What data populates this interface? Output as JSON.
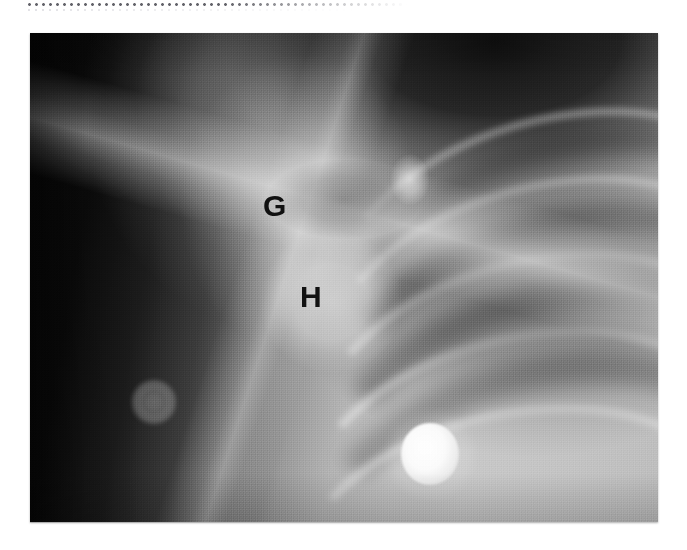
{
  "page": {
    "background_color": "#ffffff",
    "width": 687,
    "height": 550
  },
  "scan_artifact": {
    "name": "dotted-scan-line",
    "description": "faint dotted horizontal line along the very top of the page"
  },
  "radiograph": {
    "modality": "X-ray",
    "view": "shoulder / upper chest radiograph",
    "frame": {
      "left": 30,
      "top": 33,
      "width": 628,
      "height": 489
    },
    "background_color": "#0b0b0b",
    "bright_color": "#c8c8c8",
    "annotations": [
      {
        "id": "g",
        "letter": "G",
        "meaning": "glenoid",
        "x": 233,
        "y": 158,
        "color": "#111111"
      },
      {
        "id": "h",
        "letter": "H",
        "meaning": "humeral head",
        "x": 270,
        "y": 249,
        "color": "#111111"
      }
    ],
    "objects": [
      {
        "id": "ecg-electrode",
        "label": "bright round radiopaque marker",
        "x": 400,
        "y": 421,
        "radius": 29
      },
      {
        "id": "faint-disc",
        "label": "faint circular disc over dark soft tissue",
        "x": 124,
        "y": 369,
        "radius": 22
      }
    ],
    "ribs": [
      {
        "id": "rib-1",
        "left": 300,
        "top": 84,
        "width": 430,
        "height": 250,
        "rotate": -16,
        "thickness": 7,
        "opacity": 0.38
      },
      {
        "id": "rib-2",
        "left": 292,
        "top": 150,
        "width": 430,
        "height": 250,
        "rotate": -15,
        "thickness": 8,
        "opacity": 0.4
      },
      {
        "id": "rib-3",
        "left": 282,
        "top": 224,
        "width": 430,
        "height": 250,
        "rotate": -14,
        "thickness": 9,
        "opacity": 0.42
      },
      {
        "id": "rib-4",
        "left": 272,
        "top": 300,
        "width": 430,
        "height": 250,
        "rotate": -13,
        "thickness": 9,
        "opacity": 0.4
      },
      {
        "id": "rib-5",
        "left": 262,
        "top": 376,
        "width": 430,
        "height": 250,
        "rotate": -12,
        "thickness": 9,
        "opacity": 0.34
      }
    ],
    "intercostals": [
      {
        "id": "ic-1",
        "left": 300,
        "top": 104,
        "width": 430,
        "height": 250,
        "rotate": -16,
        "thickness": 26,
        "opacity": 0.22
      },
      {
        "id": "ic-2",
        "left": 292,
        "top": 176,
        "width": 430,
        "height": 250,
        "rotate": -15,
        "thickness": 30,
        "opacity": 0.26
      },
      {
        "id": "ic-3",
        "left": 282,
        "top": 250,
        "width": 430,
        "height": 250,
        "rotate": -14,
        "thickness": 32,
        "opacity": 0.26
      },
      {
        "id": "ic-4",
        "left": 272,
        "top": 326,
        "width": 430,
        "height": 250,
        "rotate": -13,
        "thickness": 32,
        "opacity": 0.22
      }
    ]
  }
}
